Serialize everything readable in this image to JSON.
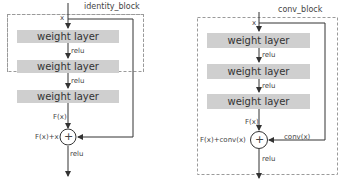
{
  "diagrams": [
    {
      "id": "identity_block",
      "title": "identity_block",
      "input_label": "x",
      "layers": [
        {
          "label": "weight layer",
          "activation_after": "relu"
        },
        {
          "label": "weight layer",
          "activation_after": "relu"
        },
        {
          "label": "weight layer",
          "activation_after": ""
        }
      ],
      "branch_output_label": "F(x)",
      "sum_label": "F(x)+x",
      "shortcut_label": "",
      "add_symbol": "+",
      "output_activation": "relu"
    },
    {
      "id": "conv_block",
      "title": "conv_block",
      "input_label": "x",
      "layers": [
        {
          "label": "weight layer",
          "activation_after": "relu"
        },
        {
          "label": "weight layer",
          "activation_after": "relu"
        },
        {
          "label": "weight layer",
          "activation_after": ""
        }
      ],
      "branch_output_label": "F(x)",
      "sum_label": "F(x)+conv(x)",
      "shortcut_label": "conv(x)",
      "add_symbol": "+",
      "output_activation": "relu"
    }
  ],
  "colors": {
    "layer_fill": "#cfcfcf",
    "line": "#333333",
    "dashed_border": "#9a9a9a"
  }
}
